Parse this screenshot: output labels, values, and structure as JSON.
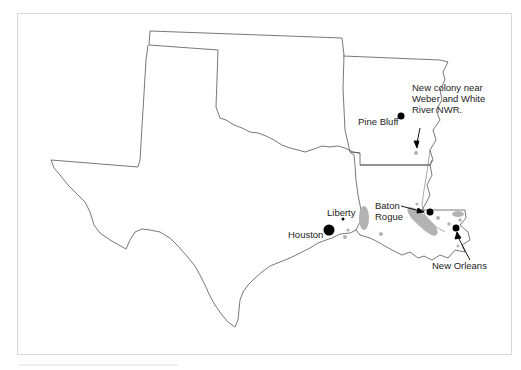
{
  "map": {
    "type": "regional-outline-map",
    "states_shown": [
      "New Mexico (partial)",
      "Oklahoma",
      "Texas",
      "Arkansas",
      "Louisiana",
      "Mississippi (partial)"
    ],
    "colors": {
      "border": "#555555",
      "city_marker": "#000000",
      "colony_area": "#b3b3b3",
      "frame": "#d8d8d8"
    },
    "labels": {
      "new_colony": [
        "New colony near",
        "Weber and White",
        "River NWR."
      ],
      "pine_bluff": "Pine Bluff",
      "liberty": "Liberty",
      "houston": "Houston",
      "baton_rouge": [
        "Baton",
        "Rogue"
      ],
      "new_orleans": "New Orleans"
    },
    "markers": [
      {
        "name": "Pine Bluff",
        "type": "city",
        "size": "medium"
      },
      {
        "name": "Houston",
        "type": "city",
        "size": "large"
      },
      {
        "name": "Liberty",
        "type": "city",
        "size": "small"
      },
      {
        "name": "Baton Rouge",
        "type": "city",
        "size": "medium"
      },
      {
        "name": "New Orleans",
        "type": "city",
        "size": "medium"
      },
      {
        "name": "New colony near Weber and White River NWR",
        "type": "colony",
        "size": "small"
      }
    ]
  }
}
